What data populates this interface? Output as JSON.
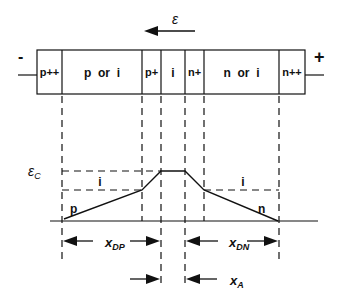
{
  "field_label": "ε",
  "terminals": {
    "left": "-",
    "right": "+"
  },
  "regions": [
    {
      "label": "p++"
    },
    {
      "label": "p  or  i"
    },
    {
      "label": "p+"
    },
    {
      "label": "i"
    },
    {
      "label": "n+"
    },
    {
      "label": "n  or  i"
    },
    {
      "label": "n++"
    }
  ],
  "profile": {
    "critical_field_label": "εC",
    "intrinsic_labels": [
      "i",
      "i"
    ],
    "p_label": "p",
    "n_label": "n"
  },
  "dimensions": {
    "xdp": {
      "main": "x",
      "sub": "DP"
    },
    "xdn": {
      "main": "x",
      "sub": "DN"
    },
    "xa": {
      "main": "x",
      "sub": "A"
    }
  }
}
